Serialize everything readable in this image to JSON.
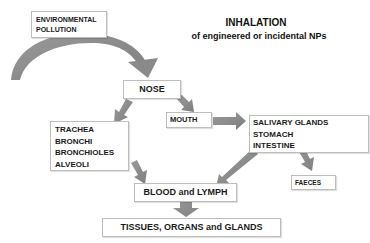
{
  "title": {
    "main": "INHALATION",
    "subtitle": "of engineered or incidental NPs"
  },
  "nodes": {
    "source": {
      "lines": [
        "ENVIRONMENTAL",
        "POLLUTION"
      ]
    },
    "nose": {
      "label": "NOSE"
    },
    "respiratory": {
      "lines": [
        "TRACHEA",
        "BRONCHI",
        "BRONCHIOLES",
        "ALVEOLI"
      ]
    },
    "mouth": {
      "label": "MOUTH"
    },
    "digestive": {
      "lines": [
        "SALIVARY GLANDS",
        "STOMACH",
        "INTESTINE"
      ]
    },
    "faeces": {
      "label": "FAECES"
    },
    "blood": {
      "label": "BLOOD and LYMPH"
    },
    "tissues": {
      "label": "TISSUES, ORGANS and GLANDS"
    }
  },
  "edges": [
    {
      "from": "ENVIRONMENTAL POLLUTION",
      "to": "NOSE"
    },
    {
      "from": "NOSE",
      "to": "TRACHEA / BRONCHI / BRONCHIOLES / ALVEOLI"
    },
    {
      "from": "NOSE",
      "to": "MOUTH"
    },
    {
      "from": "MOUTH",
      "to": "SALIVARY GLANDS / STOMACH / INTESTINE"
    },
    {
      "from": "TRACHEA / BRONCHI / BRONCHIOLES / ALVEOLI",
      "to": "BLOOD and LYMPH"
    },
    {
      "from": "SALIVARY GLANDS / STOMACH / INTESTINE",
      "to": "BLOOD and LYMPH"
    },
    {
      "from": "SALIVARY GLANDS / STOMACH / INTESTINE",
      "to": "FAECES"
    },
    {
      "from": "BLOOD and LYMPH",
      "to": "TISSUES, ORGANS and GLANDS"
    }
  ],
  "colors": {
    "arrow": "#8c8c8c",
    "box_border": "#bdbdbd",
    "text": "#1a1a1a"
  }
}
